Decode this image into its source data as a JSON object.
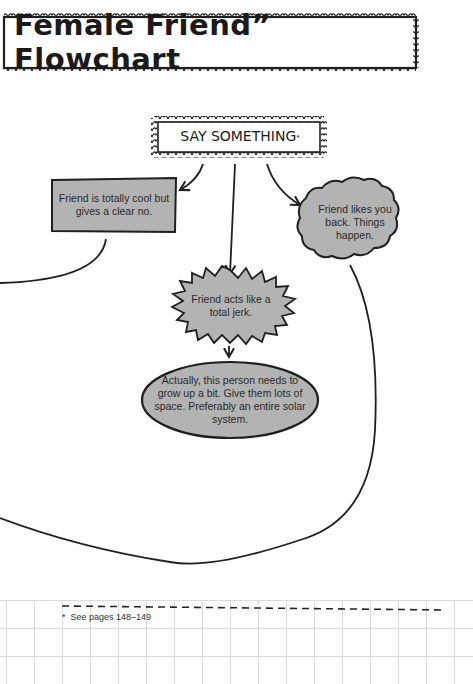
{
  "page": {
    "title": "Female Friend” Flowchart"
  },
  "flowchart": {
    "start": {
      "label": "SAY SOMETHING",
      "marker": "*"
    },
    "nodes": [
      {
        "id": "clear-no",
        "shape": "rectangle",
        "text": "Friend is totally cool but gives a clear no."
      },
      {
        "id": "likes-back",
        "shape": "cloud",
        "text": "Friend likes you back. Things happen."
      },
      {
        "id": "jerk",
        "shape": "starburst",
        "text": "Friend acts like a total jerk."
      },
      {
        "id": "grow-up",
        "shape": "oval",
        "text": "Actually, this person needs to grow up a bit. Give them lots of space. Preferably an entire solar system."
      }
    ],
    "edges": [
      {
        "from": "start",
        "to": "clear-no",
        "arrow": true
      },
      {
        "from": "start",
        "to": "jerk",
        "arrow": true
      },
      {
        "from": "start",
        "to": "likes-back",
        "arrow": true
      },
      {
        "from": "jerk",
        "to": "grow-up",
        "arrow": true
      },
      {
        "from": "clear-no",
        "to": "off-page-left",
        "arrow": false
      },
      {
        "from": "likes-back",
        "to": "off-page-left",
        "arrow": false
      }
    ],
    "colors": {
      "node_fill": "#b3b3b3",
      "stroke": "#1f1f1f",
      "background": "#ffffff",
      "grid": "#d9d9d9"
    }
  },
  "footnote": {
    "marker": "*",
    "text": "See pages 148–149"
  }
}
